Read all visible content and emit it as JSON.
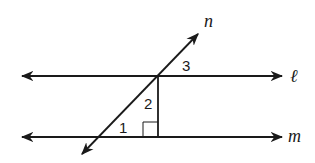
{
  "diagram": {
    "lines": [
      {
        "name": "ℓ",
        "type": "horizontal line"
      },
      {
        "name": "m",
        "type": "horizontal line"
      },
      {
        "name": "n",
        "type": "transversal"
      }
    ],
    "angles": [
      "1",
      "2",
      "3"
    ],
    "labels": {
      "n": "n",
      "l": "ℓ",
      "m": "m",
      "a1": "1",
      "a2": "2",
      "a3": "3"
    },
    "right_angle_marker": true,
    "stroke_color": "#1a1a1a"
  }
}
